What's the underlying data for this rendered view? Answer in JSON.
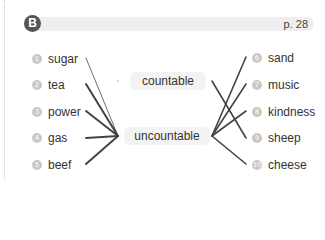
{
  "section": {
    "badge": "B",
    "page_ref": "p. 28"
  },
  "left_items": [
    {
      "num": "1",
      "word": "sugar"
    },
    {
      "num": "2",
      "word": "tea"
    },
    {
      "num": "3",
      "word": "power"
    },
    {
      "num": "4",
      "word": "gas"
    },
    {
      "num": "5",
      "word": "beef"
    }
  ],
  "categories": {
    "countable": "countable",
    "uncountable": "uncountable"
  },
  "right_items": [
    {
      "num": "6",
      "word": "sand"
    },
    {
      "num": "7",
      "word": "music"
    },
    {
      "num": "8",
      "word": "kindness"
    },
    {
      "num": "9",
      "word": "sheep"
    },
    {
      "num": "10",
      "word": "cheese"
    }
  ]
}
